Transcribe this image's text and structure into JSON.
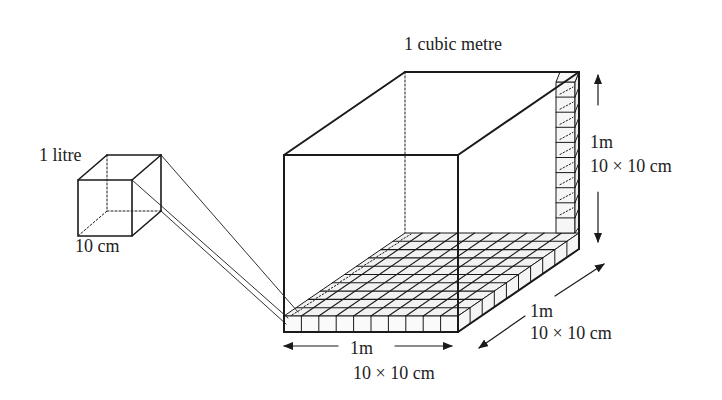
{
  "diagram": {
    "title": "1 cubic metre",
    "small_cube": {
      "label": "1 litre",
      "edge_label": "10 cm"
    },
    "big_cube": {
      "height_label": "1m",
      "height_sub": "10 × 10 cm",
      "depth_label": "1m",
      "depth_sub": "10 × 10 cm",
      "width_label": "1m",
      "width_sub": "10 × 10 cm"
    },
    "grid_divisions": 10,
    "colors": {
      "line": "#1a1a1a",
      "grid_fill": "#f2f2f2"
    }
  }
}
